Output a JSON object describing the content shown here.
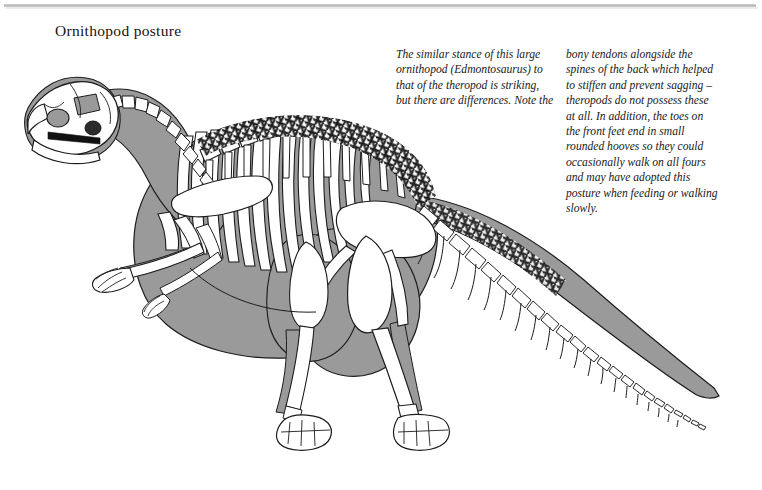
{
  "page": {
    "title": "Ornithopod posture",
    "background_color": "#ffffff",
    "rule_color": "#b9b9b9"
  },
  "caption": {
    "column_1": "The similar stance of this large ornithopod (Edmontosaurus) to that of the theropod is striking, but there are differences. Note the",
    "column_2": "bony tendons alongside the spines of the back which helped to stiffen and prevent sagging – theropods do not possess these at all. In addition, the toes on the front feet end in small rounded hooves so they could occasionally walk on all fours and may have adopted this posture when feeding or walking slowly."
  },
  "figure": {
    "name": "edmontosaurus-skeleton-illustration",
    "subject": "Edmontosaurus",
    "body_silhouette_color": "#9a9a9a",
    "bone_fill_color": "#ffffff",
    "outline_color": "#1a1a1a",
    "parts": [
      "skull",
      "cervical-vertebrae",
      "scapula",
      "ribcage",
      "dorsal-vertebrae",
      "ossified-tendons",
      "pelvis",
      "femur",
      "tibia",
      "hind-foot",
      "forelimb",
      "manus",
      "caudal-vertebrae",
      "chevrons",
      "tail"
    ]
  }
}
